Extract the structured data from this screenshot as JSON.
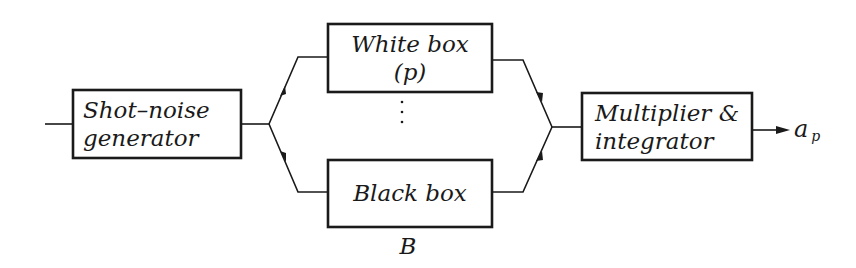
{
  "diagram": {
    "type": "block-diagram",
    "blocks": {
      "shot_noise": {
        "line1": "Shot–noise",
        "line2": "generator"
      },
      "white_box": {
        "line1": "White box",
        "line2": "(p)"
      },
      "black_box": {
        "line1": "Black box",
        "caption": "B"
      },
      "multiplier": {
        "line1": "Multiplier &",
        "line2": "integrator"
      }
    },
    "ellipsis": "⋮",
    "output": {
      "symbol": "a",
      "subscript": "p"
    },
    "colors": {
      "ink": "#1a1a1a",
      "background": "#ffffff"
    }
  }
}
